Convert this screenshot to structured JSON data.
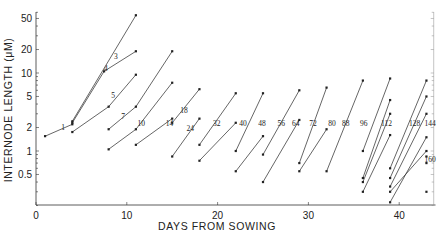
{
  "chart_data": {
    "type": "line",
    "title": "",
    "xlabel": "DAYS FROM SOWING",
    "ylabel": "INTERNODE LENGTH (μM)",
    "y_scale": "log",
    "xlim": [
      0,
      44
    ],
    "ylim": [
      0.2,
      60
    ],
    "x_ticks": [
      0,
      10,
      20,
      30,
      40
    ],
    "y_ticks": [
      0.5,
      1,
      2,
      5,
      10,
      20,
      50
    ],
    "y_tick_labels": [
      "0.5",
      "1",
      "2",
      "5",
      "10",
      "20",
      "50"
    ],
    "grid": false,
    "legend": "none",
    "series": [
      {
        "name": "1",
        "points": [
          [
            1,
            1.55
          ],
          [
            4,
            2.2
          ]
        ]
      },
      {
        "name": "2",
        "points": [
          [
            4,
            2.4
          ],
          [
            11,
            55
          ]
        ]
      },
      {
        "name": "3",
        "points": [
          [
            4,
            2.3
          ],
          [
            7.5,
            10.5
          ],
          [
            11,
            19
          ]
        ]
      },
      {
        "name": "5",
        "points": [
          [
            4,
            1.75
          ],
          [
            8,
            3.7
          ],
          [
            11,
            9.5
          ]
        ]
      },
      {
        "name": "7",
        "points": [
          [
            8,
            1.9
          ],
          [
            11,
            3.7
          ],
          [
            15,
            19
          ]
        ]
      },
      {
        "name": "10",
        "points": [
          [
            8,
            1.05
          ],
          [
            11,
            1.9
          ],
          [
            15,
            7.5
          ]
        ]
      },
      {
        "name": "14",
        "points": [
          [
            11,
            1.2
          ],
          [
            15,
            2.6
          ]
        ]
      },
      {
        "name": "18",
        "points": [
          [
            15,
            2.3
          ],
          [
            18,
            6.2
          ]
        ]
      },
      {
        "name": "24",
        "points": [
          [
            15,
            0.85
          ],
          [
            18,
            2.6
          ]
        ]
      },
      {
        "name": "32",
        "points": [
          [
            18,
            1.2
          ],
          [
            22,
            5.5
          ]
        ]
      },
      {
        "name": "40",
        "points": [
          [
            18,
            0.75
          ],
          [
            22,
            2.3
          ]
        ]
      },
      {
        "name": "48",
        "points": [
          [
            22,
            1.0
          ],
          [
            25,
            5.5
          ]
        ]
      },
      {
        "name": "56",
        "points": [
          [
            22,
            0.55
          ],
          [
            25,
            1.55
          ]
        ]
      },
      {
        "name": "64",
        "points": [
          [
            25,
            0.9
          ],
          [
            29,
            6.0
          ]
        ]
      },
      {
        "name": "72",
        "points": [
          [
            25,
            0.4
          ],
          [
            29,
            2.5
          ]
        ]
      },
      {
        "name": "80",
        "points": [
          [
            29,
            0.7
          ],
          [
            32,
            6.5
          ]
        ]
      },
      {
        "name": "88",
        "points": [
          [
            29,
            0.55
          ],
          [
            32,
            1.9
          ]
        ]
      },
      {
        "name": "96",
        "points": [
          [
            32,
            0.55
          ],
          [
            36,
            8.0
          ]
        ]
      },
      {
        "name": "112",
        "points": [
          [
            36,
            1.0
          ],
          [
            39,
            8.5
          ]
        ]
      },
      {
        "name": "112b",
        "points": [
          [
            36,
            0.45
          ],
          [
            39,
            4.5
          ]
        ]
      },
      {
        "name": "128",
        "points": [
          [
            36,
            0.4
          ],
          [
            39,
            3.0
          ]
        ]
      },
      {
        "name": "128b",
        "points": [
          [
            36,
            0.3
          ],
          [
            39,
            1.6
          ]
        ]
      },
      {
        "name": "144",
        "points": [
          [
            39,
            0.6
          ],
          [
            43,
            8.0
          ]
        ]
      },
      {
        "name": "144b",
        "points": [
          [
            39,
            0.45
          ],
          [
            43,
            5.0
          ]
        ]
      },
      {
        "name": "144c",
        "points": [
          [
            39,
            0.35
          ],
          [
            43,
            3.0
          ]
        ]
      },
      {
        "name": "160",
        "points": [
          [
            39,
            0.22
          ],
          [
            43,
            1.5
          ]
        ]
      },
      {
        "name": "160b",
        "points": [
          [
            39,
            0.3
          ],
          [
            43,
            1.0
          ]
        ]
      }
    ],
    "extra_points": [
      [
        43,
        0.7
      ],
      [
        43,
        0.85
      ],
      [
        43,
        0.3
      ]
    ],
    "annotations": [
      {
        "text": "1",
        "x": 3.0,
        "y": 2.05
      },
      {
        "text": "3",
        "x": 8.8,
        "y": 16.5
      },
      {
        "text": "4",
        "x": 7.7,
        "y": 11.5
      },
      {
        "text": "5",
        "x": 8.5,
        "y": 5.2
      },
      {
        "text": "7",
        "x": 9.6,
        "y": 2.85
      },
      {
        "text": "10",
        "x": 11.6,
        "y": 2.3
      },
      {
        "text": "14",
        "x": 14.7,
        "y": 2.3
      },
      {
        "text": "18",
        "x": 16.3,
        "y": 3.35
      },
      {
        "text": "24",
        "x": 17.0,
        "y": 2.0
      },
      {
        "text": "32",
        "x": 19.9,
        "y": 2.3
      },
      {
        "text": "40",
        "x": 22.8,
        "y": 2.3
      },
      {
        "text": "48",
        "x": 24.9,
        "y": 2.3
      },
      {
        "text": "56",
        "x": 27.0,
        "y": 2.3
      },
      {
        "text": "64",
        "x": 28.6,
        "y": 2.3
      },
      {
        "text": "72",
        "x": 30.5,
        "y": 2.3
      },
      {
        "text": "80",
        "x": 32.6,
        "y": 2.3
      },
      {
        "text": "88",
        "x": 34.1,
        "y": 2.3
      },
      {
        "text": "96",
        "x": 36.1,
        "y": 2.3
      },
      {
        "text": "112",
        "x": 38.6,
        "y": 2.3
      },
      {
        "text": "128",
        "x": 41.7,
        "y": 2.3
      },
      {
        "text": "144",
        "x": 44.2,
        "y": 2.3
      },
      {
        "text": "160",
        "x": 44.2,
        "y": 0.8
      }
    ]
  }
}
